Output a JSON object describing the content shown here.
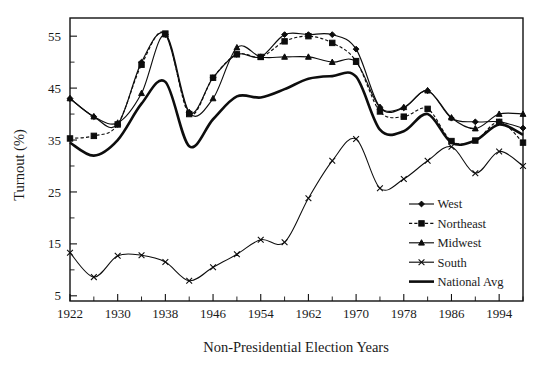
{
  "figure": {
    "background": "#ffffff",
    "ink_color": "#0d0d0d"
  },
  "axes": {
    "y_label": "Turnout (%)",
    "x_label": "Non-Presidential Election Years",
    "y_ticks": [
      "5",
      "15",
      "25",
      "35",
      "45",
      "55"
    ],
    "x_ticks": [
      "1922",
      "1930",
      "1938",
      "1946",
      "1954",
      "1962",
      "1970",
      "1978",
      "1986",
      "1994"
    ],
    "y_range": [
      4.0,
      58.5
    ],
    "x_range": [
      1922,
      1998
    ],
    "y_minor_step": 5,
    "x_minor_step": 4,
    "grid": false
  },
  "legend": {
    "position": "right-inside-lower",
    "entries": [
      {
        "label": "West",
        "marker": "diamond",
        "line": "solid",
        "width": "thin"
      },
      {
        "label": "Northeast",
        "marker": "square",
        "line": "dashed",
        "width": "thin"
      },
      {
        "label": "Midwest",
        "marker": "triangle",
        "line": "solid",
        "width": "thin"
      },
      {
        "label": "South",
        "marker": "cross",
        "line": "solid",
        "width": "thin"
      },
      {
        "label": "National Avg",
        "marker": "none",
        "line": "solid",
        "width": "thick"
      }
    ]
  },
  "chart_data": {
    "type": "line",
    "title": "",
    "subtitle": "",
    "xlabel": "Non-Presidential Election Years",
    "ylabel": "Turnout (%)",
    "xlim": [
      1922,
      1998
    ],
    "ylim": [
      4.0,
      58.5
    ],
    "grid": false,
    "legend_position": "right-inside-lower",
    "x": [
      1922,
      1926,
      1930,
      1934,
      1938,
      1942,
      1946,
      1950,
      1954,
      1958,
      1962,
      1966,
      1970,
      1974,
      1978,
      1982,
      1986,
      1990,
      1994,
      1998
    ],
    "series": [
      {
        "name": "West",
        "marker": "diamond",
        "linestyle": "solid",
        "values": [
          43.0,
          39.5,
          38.0,
          50.0,
          55.3,
          40.3,
          47.0,
          51.5,
          51.0,
          55.3,
          55.3,
          55.3,
          52.5,
          41.3,
          41.2,
          44.5,
          39.2,
          38.5,
          38.5,
          37.3
        ]
      },
      {
        "name": "Northeast",
        "marker": "square",
        "linestyle": "dashed",
        "values": [
          35.3,
          35.8,
          38.0,
          49.5,
          55.5,
          40.0,
          47.0,
          51.5,
          51.0,
          54.0,
          55.0,
          53.7,
          50.2,
          40.5,
          39.5,
          41.0,
          34.8,
          34.9,
          38.5,
          34.5
        ]
      },
      {
        "name": "Midwest",
        "marker": "triangle",
        "linestyle": "solid",
        "values": [
          43.0,
          39.5,
          38.3,
          44.0,
          55.3,
          40.3,
          43.0,
          52.8,
          51.0,
          51.0,
          51.0,
          50.0,
          50.0,
          41.3,
          41.3,
          44.5,
          39.3,
          37.2,
          40.0,
          40.0
        ]
      },
      {
        "name": "South",
        "marker": "cross",
        "linestyle": "solid",
        "values": [
          13.3,
          8.6,
          12.7,
          12.8,
          11.5,
          7.9,
          10.5,
          13.0,
          15.8,
          15.3,
          23.8,
          31.0,
          35.2,
          25.7,
          27.5,
          31.0,
          33.7,
          28.6,
          32.8,
          30.0
        ]
      },
      {
        "name": "National Avg",
        "marker": "none",
        "linestyle": "solid-thick",
        "values": [
          34.5,
          32.0,
          35.0,
          42.0,
          46.2,
          33.8,
          39.0,
          43.4,
          43.2,
          44.8,
          46.8,
          47.3,
          47.2,
          37.0,
          36.7,
          40.0,
          34.5,
          34.9,
          38.0,
          36.0
        ]
      }
    ]
  }
}
